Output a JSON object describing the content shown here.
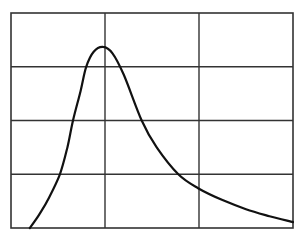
{
  "chart_data": {
    "type": "line",
    "title": "",
    "xlabel": "",
    "ylabel": "",
    "xlim": [
      0,
      3
    ],
    "ylim": [
      0,
      4
    ],
    "grid": true,
    "grid_columns": 3,
    "grid_rows": 4,
    "legend": null,
    "series": [
      {
        "name": "curve",
        "color": "#111111",
        "x": [
          0.2,
          0.3,
          0.4,
          0.52,
          0.6,
          0.66,
          0.74,
          0.8,
          0.88,
          0.98,
          1.08,
          1.2,
          1.39,
          1.55,
          1.78,
          1.99,
          2.25,
          2.5,
          2.75,
          3.0
        ],
        "y": [
          0.0,
          0.25,
          0.55,
          1.0,
          1.5,
          2.0,
          2.55,
          3.0,
          3.28,
          3.37,
          3.25,
          2.85,
          2.0,
          1.5,
          1.0,
          0.74,
          0.52,
          0.35,
          0.22,
          0.11
        ]
      }
    ]
  },
  "colors": {
    "background": "#ffffff",
    "grid": "#333333",
    "line": "#111111"
  }
}
